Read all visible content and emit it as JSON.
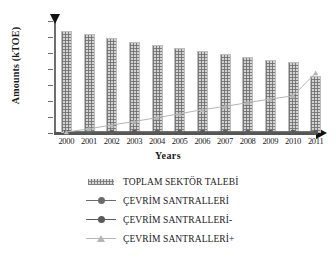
{
  "chart_data": {
    "type": "bar",
    "title": "",
    "xlabel": "Years",
    "ylabel": "Amounts  (kTOE)",
    "categories": [
      "2000",
      "2001",
      "2002",
      "2003",
      "2004",
      "2005",
      "2006",
      "2007",
      "2008",
      "2009",
      "2010",
      "2011"
    ],
    "ylim": [
      0,
      7000
    ],
    "yticks": [
      0,
      1000,
      2000,
      3000,
      4000,
      5000,
      6000,
      7000
    ],
    "ytick_labels": [
      "0",
      "1000",
      "2000",
      "3000",
      "4000",
      "5000",
      "6000",
      "7000"
    ],
    "grid": false,
    "legend_position": "bottom",
    "series": [
      {
        "name": "TOPLAM SEKTÖR TALEBİ",
        "type": "bar",
        "marker": "pattern-swatch",
        "color": "#d3d3d3",
        "values": [
          6400,
          6180,
          5930,
          5700,
          5500,
          5300,
          5120,
          4960,
          4760,
          4580,
          4410,
          3560
        ]
      },
      {
        "name": "ÇEVRİM SANTRALLERİ",
        "type": "line",
        "marker": "circle",
        "color": "#6b6b6b",
        "values": [
          60,
          60,
          60,
          60,
          60,
          60,
          60,
          60,
          60,
          60,
          60,
          60
        ]
      },
      {
        "name": "ÇEVRİM SANTRALLERİ-",
        "type": "line",
        "marker": "circle",
        "color": "#5a5a5a",
        "values": [
          40,
          40,
          40,
          40,
          40,
          40,
          40,
          40,
          40,
          40,
          40,
          40
        ]
      },
      {
        "name": "ÇEVRİM SANTRALLERİ+",
        "type": "line",
        "marker": "triangle",
        "color": "#b5b5b5",
        "values": [
          60,
          260,
          500,
          720,
          960,
          1200,
          1460,
          1660,
          1900,
          2120,
          2320,
          3760
        ]
      }
    ]
  },
  "axes": {
    "x_title": "Years",
    "y_title": "Amounts  (kTOE)"
  },
  "legend": {
    "items": [
      {
        "label": "TOPLAM SEKTÖR TALEBİ",
        "key": "pattern-swatch",
        "color": "#d3d3d3"
      },
      {
        "label": "ÇEVRİM SANTRALLERİ",
        "key": "line-circle",
        "color": "#6b6b6b"
      },
      {
        "label": "ÇEVRİM SANTRALLERİ-",
        "key": "line-circle",
        "color": "#5a5a5a"
      },
      {
        "label": "ÇEVRİM SANTRALLERİ+",
        "key": "line-triangle",
        "color": "#b5b5b5"
      }
    ]
  }
}
